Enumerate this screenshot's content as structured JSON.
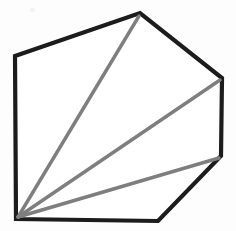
{
  "figure": {
    "background_color": "#fdfdfd",
    "canvas": {
      "width": 236,
      "height": 231
    },
    "outline": {
      "name": "hexagon-outline",
      "color": "#1c1c1c",
      "stroke_width": 4.2,
      "fill_color": "#ffffff",
      "closed": true,
      "vertex_count": 6,
      "vertices": [
        {
          "label": "bottom-left",
          "x": 16,
          "y": 219
        },
        {
          "label": "left",
          "x": 15,
          "y": 56
        },
        {
          "label": "top",
          "x": 140,
          "y": 13
        },
        {
          "label": "right",
          "x": 222,
          "y": 78
        },
        {
          "label": "lower-right",
          "x": 221,
          "y": 156
        },
        {
          "label": "bottom-right",
          "x": 158,
          "y": 221
        }
      ],
      "points_attr": "16,219 15,56 140,13 222,78 221,156 158,221"
    },
    "diagonals": {
      "name": "fan-diagonals",
      "color": "#7e7e7e",
      "stroke_width": 3.4,
      "origin": {
        "label": "bottom-left",
        "x": 18,
        "y": 217
      },
      "count": 3,
      "lines": [
        {
          "label": "diagonal-to-top",
          "x1": 18,
          "y1": 217,
          "x2": 139,
          "y2": 16
        },
        {
          "label": "diagonal-to-right",
          "x1": 18,
          "y1": 217,
          "x2": 220,
          "y2": 80
        },
        {
          "label": "diagonal-to-lower-right",
          "x1": 18,
          "y1": 217,
          "x2": 219,
          "y2": 158
        }
      ]
    },
    "artifacts": [
      {
        "label": "scan-speck",
        "x": 30,
        "y": 8
      }
    ]
  }
}
